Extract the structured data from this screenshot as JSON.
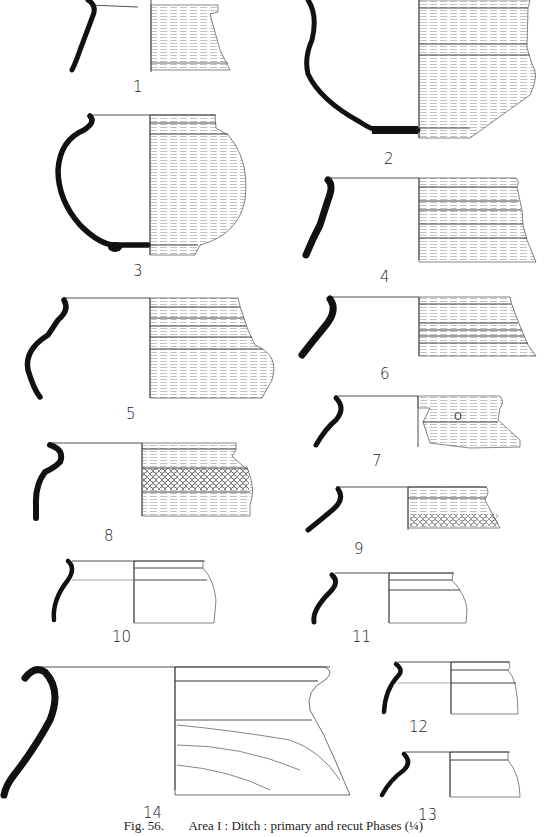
{
  "figure": {
    "number": "Fig. 56.",
    "caption": "Area I : Ditch : primary and recut Phases (¼)"
  },
  "vessels": [
    {
      "id": "1",
      "label": "1"
    },
    {
      "id": "2",
      "label": "2"
    },
    {
      "id": "3",
      "label": "3"
    },
    {
      "id": "4",
      "label": "4"
    },
    {
      "id": "5",
      "label": "5"
    },
    {
      "id": "6",
      "label": "6"
    },
    {
      "id": "7",
      "label": "7"
    },
    {
      "id": "8",
      "label": "8"
    },
    {
      "id": "9",
      "label": "9"
    },
    {
      "id": "10",
      "label": "10"
    },
    {
      "id": "11",
      "label": "11"
    },
    {
      "id": "12",
      "label": "12"
    },
    {
      "id": "13",
      "label": "13"
    },
    {
      "id": "14",
      "label": "14"
    }
  ],
  "colors": {
    "ink": "#111111",
    "hatch": "#888888",
    "paper": "#ffffff"
  }
}
